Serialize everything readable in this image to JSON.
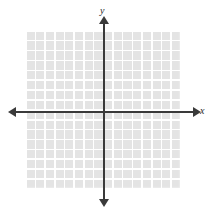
{
  "figure": {
    "kind": "coordinate-plane",
    "background_color": "#ffffff"
  },
  "axes": {
    "x_label": "x",
    "y_label": "y",
    "axis_color": "#3a3a3a",
    "origin": {
      "x": 104,
      "y": 112
    },
    "x_arrow_left": "◀",
    "x_arrow_right": "▶",
    "y_arrow_top": "▲",
    "y_arrow_bottom": "▼"
  },
  "grid": {
    "cell_fill_color": "#e4e4e4",
    "gridline_color": "#ffffff",
    "columns": 16,
    "rows": 16,
    "left": 25,
    "top": 30,
    "width": 155,
    "height": 158
  },
  "chart_data": {
    "type": "scatter",
    "title": "",
    "subtitle": "",
    "xlabel": "x",
    "ylabel": "y",
    "xlim": [
      -8,
      8
    ],
    "ylim": [
      -8,
      8
    ],
    "xticks": [],
    "yticks": [],
    "grid": true,
    "legend": null,
    "series": [
      {
        "name": "",
        "x": [],
        "y": []
      }
    ],
    "annotations": []
  }
}
